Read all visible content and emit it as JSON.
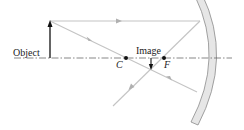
{
  "diagram": {
    "type": "concave-mirror-ray-diagram",
    "labels": {
      "object": "Object",
      "image": "Image",
      "center_of_curvature": "C",
      "focal_point": "F"
    },
    "colors": {
      "background": "#ffffff",
      "axis": "#555555",
      "ray": "#c4c4c4",
      "ray_arrow": "#b0b0b0",
      "object_arrow": "#111111",
      "image_arrow": "#111111",
      "mirror_fill": "#e6e6e6",
      "mirror_edge": "#8a8a8a",
      "point": "#111111",
      "text": "#222222"
    },
    "geometry": {
      "axis_y": 58,
      "object_x": 50,
      "object_top_y": 21,
      "center_x": 126,
      "focal_x": 164,
      "image_x": 151,
      "image_bottom_y": 69
    }
  }
}
